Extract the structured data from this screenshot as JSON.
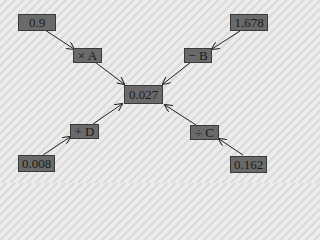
{
  "diagram": {
    "center": {
      "label": "0.027"
    },
    "inputs": [
      {
        "id": "A",
        "value": "0.9",
        "operation": "× A",
        "position": "top-left"
      },
      {
        "id": "B",
        "value": "1.678",
        "operation": "− B",
        "position": "top-right"
      },
      {
        "id": "C",
        "value": "0.162",
        "operation": "÷ C",
        "position": "bottom-right"
      },
      {
        "id": "D",
        "value": "0.008",
        "operation": "+ D",
        "position": "bottom-left"
      }
    ]
  },
  "colors": {
    "node_fill": "#6a6a6a",
    "node_border": "#3a3a3a",
    "text": "#1a1a1a",
    "arrow": "#222222"
  }
}
